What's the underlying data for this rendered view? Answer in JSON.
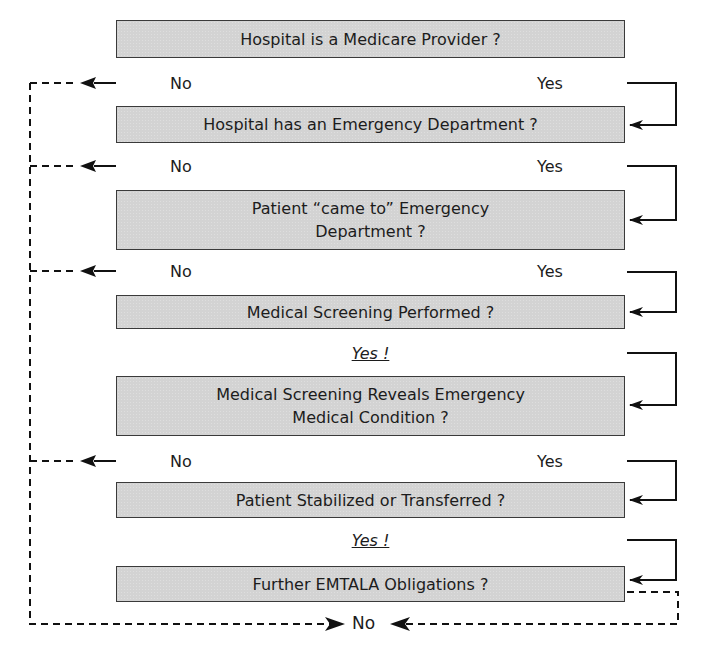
{
  "boxes": [
    {
      "id": "q1",
      "text": "Hospital is a Medicare Provider ?"
    },
    {
      "id": "q2",
      "text": "Hospital has an Emergency Department ?"
    },
    {
      "id": "q3",
      "text": "Patient “came to” Emergency Department ?"
    },
    {
      "id": "q4",
      "text": "Medical Screening Performed ?"
    },
    {
      "id": "q5",
      "text": "Medical Screening Reveals Emergency Medical Condition ?"
    },
    {
      "id": "q6",
      "text": "Patient Stabilized or Transferred ?"
    },
    {
      "id": "q7",
      "text": "Further EMTALA Obligations ?"
    }
  ],
  "branches": [
    {
      "after": "q1",
      "no": "No",
      "yes": "Yes"
    },
    {
      "after": "q2",
      "no": "No",
      "yes": "Yes"
    },
    {
      "after": "q3",
      "no": "No",
      "yes": "Yes"
    },
    {
      "after": "q4",
      "emphatic_yes": "Yes !"
    },
    {
      "after": "q5",
      "no": "No",
      "yes": "Yes"
    },
    {
      "after": "q6",
      "emphatic_yes": "Yes !"
    }
  ],
  "terminal": {
    "label": "No"
  },
  "colors": {
    "box_fill": "#d3d3d3",
    "box_border": "#3a3a3a",
    "line": "#111111"
  }
}
